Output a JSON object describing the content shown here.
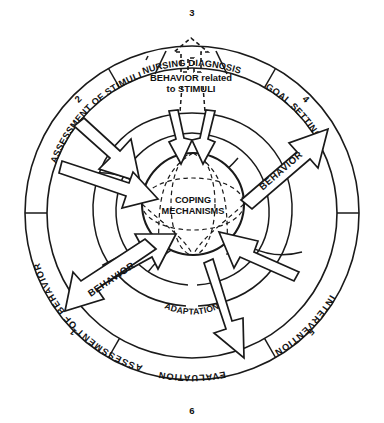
{
  "figure": {
    "type": "concentric-circular-process-diagram",
    "colors": {
      "stroke": "#1a1a1a",
      "background": "#ffffff",
      "text": "#111111"
    }
  },
  "outer_ring": {
    "name": "nursing-process-steps-ring",
    "segments": [
      {
        "number": "1",
        "label": "ASSESSMENT OF BEHAVIOR",
        "position": "lower-left"
      },
      {
        "number": "2",
        "label": "ASSESSMENT OF STIMULI",
        "position": "upper-left"
      },
      {
        "number": "3",
        "label": "NURSING DIAGNOSIS",
        "position": "top"
      },
      {
        "number": "4",
        "label": "GOAL SETTING",
        "position": "upper-right"
      },
      {
        "number": "5",
        "label": "INTERVENTION",
        "position": "lower-right"
      },
      {
        "number": "6",
        "label": "EVALUATION",
        "position": "bottom"
      }
    ]
  },
  "inner_labels": {
    "adaptation": "ADAPTATION",
    "core_line_1": "COPING",
    "core_line_2": "MECHANISMS"
  },
  "annotations": {
    "stimuli_note_line_1": "BEHAVIOR related",
    "stimuli_note_line_2": "to STIMULI",
    "behavior_out_upper_right": "BEHAVIOR",
    "behavior_out_lower_left": "BEHAVIOR"
  },
  "icons": {
    "arrow_in": "arrow-inward-icon",
    "arrow_out": "arrow-outward-icon",
    "arrow_dashed_up": "dashed-arrow-up-icon"
  }
}
